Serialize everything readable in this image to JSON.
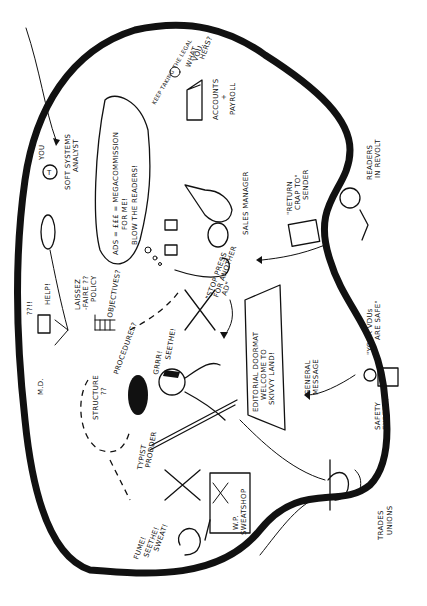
{
  "diagram": {
    "orientation": "rotated-90-clockwise",
    "boundary": {
      "shape": "organic-blob",
      "stroke_color": "#111111",
      "background": "#ffffff"
    },
    "labels": {
      "you": "YOU",
      "soft_systems_analyst_1": "SOFT SYSTEMS",
      "soft_systems_analyst_2": "ANALYST",
      "md": "M.D.",
      "help": "HELP!",
      "md_question": "??!!",
      "laissez_1": "LAISSEZ",
      "laissez_2": "-FAIRE ??",
      "laissez_3": "POLICY",
      "objectives": "OBJECTIVES?",
      "procedures": "PROCEDURES?",
      "structure_1": "STRUCTURE",
      "structure_2": "??",
      "ads_bubble_1": "ADS = £££ = MEGACOMMISSION",
      "ads_bubble_2": "FOR ME!",
      "ads_bubble_3": "BLOW THE READERS!",
      "grrr": "GRRR!",
      "seethe": "SEETHE!",
      "stop_press_1": "\"STOP PRESS",
      "stop_press_2": "FOR ANOTHER",
      "stop_press_3": "AD\"",
      "editorial_1": "EDITORIAL DOORMAT",
      "editorial_2": "WELCOME TO",
      "editorial_3": "SKIVVY LAND!",
      "typist_prodder_1": "TYPIST",
      "typist_prodder_2": "PRODDER",
      "fume_1": "FUME!",
      "fume_2": "SEETHE!",
      "fume_3": "SWEAT!",
      "wp_sweatshop_1": "W.P.",
      "wp_sweatshop_2": "SWEATSHOP",
      "sales_manager": "SALES MANAGER",
      "accounts_1": "ACCOUNTS",
      "accounts_2": "+",
      "accounts_3": "PAYROLL",
      "what_vouchers_1": "WHAT",
      "what_vouchers_2": "VOU.",
      "what_vouchers_3": "HERS?",
      "keep_taking": "KEEP TAKING THE LEGAL",
      "return_crap_1": "\"RETURN",
      "return_crap_2": "CRAP TO\"",
      "return_crap_3": "SENDER",
      "readers_1": "READERS",
      "readers_2": "IN REVOLT",
      "general_message_1": "GENERAL",
      "general_message_2": "MESSAGE",
      "safety_expert_1": "SAFETY",
      "safety_expert_2": "EXPERT",
      "your_vdus_1": "\"YOUR VDUs",
      "your_vdus_2": "ARE SAFE\"",
      "trades_unions_1": "TRADES",
      "trades_unions_2": "UNIONS"
    }
  }
}
